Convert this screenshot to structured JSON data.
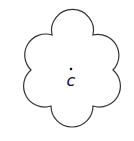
{
  "diagram": {
    "shape": "six-petal flower",
    "center_label": "c",
    "center_dot": true,
    "stroke_color": "#333333",
    "fill_color": "#ffffff"
  }
}
